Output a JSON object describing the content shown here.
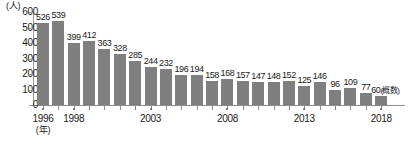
{
  "chart_data": {
    "type": "bar",
    "title": "",
    "subtitle": "",
    "xlabel": "(年)",
    "ylabel": "(人)",
    "ylim": [
      0,
      600
    ],
    "ytick_values": [
      600,
      500,
      400,
      300,
      200,
      100,
      0
    ],
    "ytick_labels": [
      "600",
      "500",
      "400",
      "300",
      "200",
      "100",
      "0"
    ],
    "grid": false,
    "legend": null,
    "bar_color": "#7f7f7f",
    "categories": [
      "1996",
      "1997",
      "1998",
      "1999",
      "2000",
      "2001",
      "2002",
      "2003",
      "2004",
      "2005",
      "2006",
      "2007",
      "2008",
      "2009",
      "2010",
      "2011",
      "2012",
      "2013",
      "2014",
      "2015",
      "2016",
      "2017",
      "2018"
    ],
    "values": [
      526,
      539,
      399,
      412,
      363,
      328,
      285,
      244,
      232,
      196,
      194,
      158,
      168,
      157,
      147,
      148,
      152,
      125,
      146,
      96,
      109,
      77,
      60
    ],
    "value_labels": [
      "526",
      "539",
      "399",
      "412",
      "363",
      "328",
      "285",
      "244",
      "232",
      "196",
      "194",
      "158",
      "168",
      "157",
      "147",
      "148",
      "152",
      "125",
      "146",
      "96",
      "109",
      "77",
      "60"
    ],
    "annotations": [
      {
        "index": 22,
        "text": "(概数)"
      }
    ],
    "labeled_xticks": [
      "1996",
      "1998",
      "2003",
      "2008",
      "2013",
      "2018"
    ]
  }
}
